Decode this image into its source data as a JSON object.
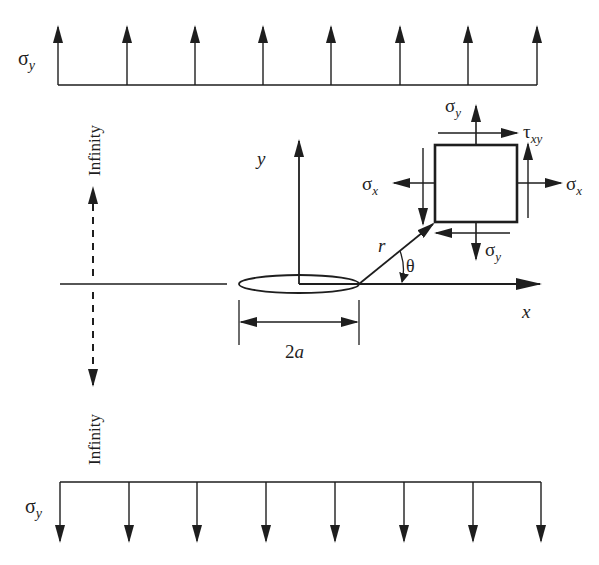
{
  "figure": {
    "colors": {
      "ink": "#1e1e1e",
      "background": "#ffffff"
    }
  },
  "labels": {
    "top_load": {
      "symbol": "σ",
      "subscript": "y"
    },
    "bottom_load": {
      "symbol": "σ",
      "subscript": "y"
    },
    "infinity_top": "Infinity",
    "infinity_bottom": "Infinity",
    "y_axis": "y",
    "x_axis": "x",
    "radius": "r",
    "angle": "θ",
    "crack_length": {
      "number": "2",
      "variable": "a"
    },
    "element": {
      "sigma_y_top": {
        "symbol": "σ",
        "subscript": "y"
      },
      "tau_xy": {
        "symbol": "τ",
        "subscript": "xy"
      },
      "sigma_x_left": {
        "symbol": "σ",
        "subscript": "x"
      },
      "sigma_x_right": {
        "symbol": "σ",
        "subscript": "x"
      },
      "sigma_y_bottom": {
        "symbol": "σ",
        "subscript": "y"
      }
    }
  },
  "load_arrows": {
    "top_count": 8,
    "bottom_count": 8,
    "direction_top": "up",
    "direction_bottom": "down"
  }
}
